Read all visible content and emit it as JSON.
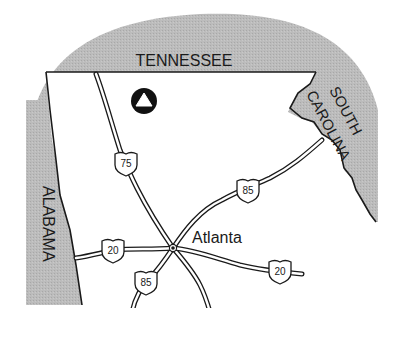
{
  "map": {
    "states": {
      "north": "TENNESSEE",
      "west": "ALABAMA",
      "east_line1": "SOUTH",
      "east_line2": "CAROLINA"
    },
    "city": {
      "name": "Atlanta"
    },
    "highways": [
      {
        "id": "i75-north",
        "number": "75",
        "type": "interstate"
      },
      {
        "id": "i85-northeast",
        "number": "85",
        "type": "interstate"
      },
      {
        "id": "i85-southwest",
        "number": "85",
        "type": "interstate"
      },
      {
        "id": "i20-west",
        "number": "20",
        "type": "interstate"
      },
      {
        "id": "i20-east",
        "number": "20",
        "type": "interstate"
      }
    ],
    "marker": {
      "icon": "triangle-in-circle-icon"
    },
    "colors": {
      "neighbor_state_fill": "#b8b8b8",
      "state_fill": "#ffffff",
      "border": "#1a1a1a",
      "background": "#ffffff"
    }
  }
}
